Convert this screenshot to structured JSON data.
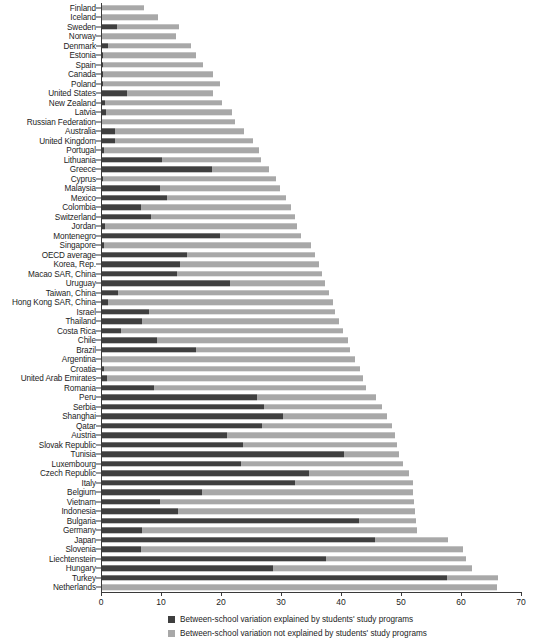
{
  "chart_data": {
    "type": "bar",
    "orientation": "horizontal",
    "stacked": true,
    "title": "",
    "subtitle": "",
    "xlabel": "",
    "ylabel": "",
    "xlim": [
      0,
      70
    ],
    "xticks": [
      0,
      10,
      20,
      30,
      40,
      50,
      60,
      70
    ],
    "grid": false,
    "legend_position": "bottom",
    "colors": {
      "explained": "#3f3f3f",
      "not_explained": "#a8a8a8"
    },
    "legend": [
      "Between-school variation explained by students' study programs",
      "Between-school variation not explained by students' study programs"
    ],
    "series": [
      {
        "name": "Between-school variation explained by students' study programs",
        "key": "explained",
        "color": "#3f3f3f",
        "values": [
          0.0,
          0.0,
          2.6,
          0.0,
          1.2,
          0.3,
          0.3,
          0.3,
          0.3,
          4.4,
          0.6,
          0.8,
          0.2,
          2.4,
          2.3,
          0.5,
          10.1,
          18.5,
          0.4,
          9.8,
          11.0,
          6.6,
          8.3,
          0.7,
          19.9,
          0.5,
          14.3,
          13.2,
          12.7,
          21.5,
          2.8,
          1.2,
          8.0,
          6.8,
          3.3,
          9.3,
          15.8,
          0.2,
          0.5,
          1.0,
          8.9,
          26.0,
          27.1,
          30.3,
          26.8,
          21.0,
          23.7,
          40.5,
          23.4,
          34.6,
          32.3,
          16.8,
          9.9,
          12.9,
          43.0,
          6.8,
          45.6,
          6.6,
          37.5,
          28.6,
          57.6,
          0.0
        ]
      },
      {
        "name": "Between-school variation not explained by students' study programs",
        "key": "not_explained",
        "color": "#a8a8a8",
        "values": [
          7.2,
          9.5,
          10.4,
          12.5,
          13.8,
          15.5,
          16.7,
          18.3,
          19.5,
          14.2,
          19.6,
          21.0,
          22.1,
          21.4,
          23.0,
          25.9,
          16.6,
          9.5,
          28.8,
          20.0,
          19.8,
          25.1,
          24.0,
          32.0,
          13.4,
          34.5,
          21.4,
          23.2,
          24.1,
          15.9,
          35.2,
          37.4,
          31.0,
          32.9,
          37.0,
          31.8,
          25.7,
          42.1,
          42.7,
          42.6,
          35.2,
          19.9,
          19.8,
          17.3,
          21.7,
          28.0,
          25.6,
          9.1,
          26.9,
          16.7,
          19.7,
          35.2,
          42.2,
          39.4,
          9.5,
          45.8,
          12.3,
          53.7,
          23.3,
          33.3,
          8.5,
          66.0
        ]
      }
    ],
    "categories": [
      "Finland",
      "Iceland",
      "Sweden",
      "Norway",
      "Denmark",
      "Estonia",
      "Spain",
      "Canada",
      "Poland",
      "United States",
      "New Zealand",
      "Latvia",
      "Russian Federation",
      "Australia",
      "United Kingdom",
      "Portugal",
      "Lithuania",
      "Greece",
      "Cyprus",
      "Malaysia",
      "Mexico",
      "Colombia",
      "Switzerland",
      "Jordan",
      "Montenegro",
      "Singapore",
      "OECD average",
      "Korea, Rep.",
      "Macao SAR, China",
      "Uruguay",
      "Taiwan, China",
      "Hong Kong SAR, China",
      "Israel",
      "Thailand",
      "Costa Rica",
      "Chile",
      "Brazil",
      "Argentina",
      "Croatia",
      "United Arab Emirates",
      "Romania",
      "Peru",
      "Serbia",
      "Shanghai",
      "Qatar",
      "Austria",
      "Slovak Republic",
      "Tunisia",
      "Luxembourg",
      "Czech Republic",
      "Italy",
      "Belgium",
      "Vietnam",
      "Indonesia",
      "Bulgaria",
      "Germany",
      "Japan",
      "Slovenia",
      "Liechtenstein",
      "Hungary",
      "Turkey",
      "Netherlands"
    ]
  }
}
